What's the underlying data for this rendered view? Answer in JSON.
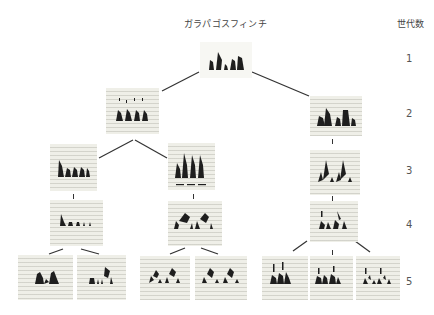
{
  "header": {
    "title": "ガラパゴスフィンチ",
    "generation_label": "世代数"
  },
  "generations": [
    "1",
    "2",
    "3",
    "4",
    "5"
  ],
  "tree": {
    "description": "Genealogy of Galápagos finch song spectrograms across 5 generations",
    "nodes": [
      {
        "id": "g1",
        "generation": 1,
        "label": "sonogram"
      },
      {
        "id": "g2a",
        "generation": 2,
        "parent": "g1",
        "label": "sonogram"
      },
      {
        "id": "g2b",
        "generation": 2,
        "parent": "g1",
        "label": "sonogram"
      },
      {
        "id": "g3a",
        "generation": 3,
        "parent": "g2a",
        "label": "sonogram"
      },
      {
        "id": "g3b",
        "generation": 3,
        "parent": "g2a",
        "label": "sonogram"
      },
      {
        "id": "g3c",
        "generation": 3,
        "parent": "g2b",
        "label": "sonogram"
      },
      {
        "id": "g4a",
        "generation": 4,
        "parent": "g3a",
        "label": "sonogram"
      },
      {
        "id": "g4b",
        "generation": 4,
        "parent": "g3b",
        "label": "sonogram"
      },
      {
        "id": "g4c",
        "generation": 4,
        "parent": "g3c",
        "label": "sonogram"
      },
      {
        "id": "g5a",
        "generation": 5,
        "parent": "g4a",
        "label": "sonogram"
      },
      {
        "id": "g5b",
        "generation": 5,
        "parent": "g4a",
        "label": "sonogram"
      },
      {
        "id": "g5c",
        "generation": 5,
        "parent": "g4b",
        "label": "sonogram"
      },
      {
        "id": "g5d",
        "generation": 5,
        "parent": "g4b",
        "label": "sonogram"
      },
      {
        "id": "g5e",
        "generation": 5,
        "parent": "g4c",
        "label": "sonogram"
      },
      {
        "id": "g5f",
        "generation": 5,
        "parent": "g4c",
        "label": "sonogram"
      },
      {
        "id": "g5g",
        "generation": 5,
        "parent": "g4c",
        "label": "sonogram"
      }
    ]
  },
  "colors": {
    "ink": "#1e1e1e",
    "panel": "#efefe8",
    "lines": "#333333"
  }
}
